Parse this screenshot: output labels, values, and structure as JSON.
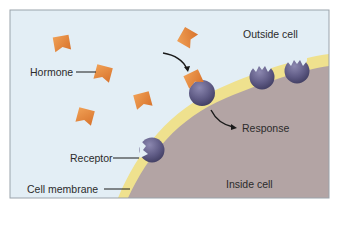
{
  "diagram": {
    "type": "cell-signaling-illustration",
    "regions": {
      "outside": {
        "label": "Outside cell",
        "color": "#e3eef5"
      },
      "inside": {
        "label": "Inside cell",
        "color": "#b3a4a4"
      },
      "membrane": {
        "label": "Cell membrane",
        "color": "#efe18e"
      }
    },
    "labels": {
      "hormone": "Hormone",
      "receptor": "Receptor",
      "cell_membrane": "Cell membrane",
      "outside_cell": "Outside cell",
      "inside_cell": "Inside cell",
      "response": "Response"
    },
    "colors": {
      "hormone": "#e98a3c",
      "receptor": "#6e6a92",
      "frame": "#9aa3ab",
      "arrow": "#1a1a1a"
    },
    "hormones": [
      {
        "x": 62,
        "y": 44,
        "rotate": -10
      },
      {
        "x": 103,
        "y": 74,
        "rotate": 15
      },
      {
        "x": 143,
        "y": 102,
        "rotate": -20
      },
      {
        "x": 85,
        "y": 117,
        "rotate": 20
      },
      {
        "x": 188,
        "y": 38,
        "rotate": 25
      }
    ],
    "bound_hormone": {
      "x": 194,
      "y": 79,
      "rotate": -25
    },
    "receptors": [
      {
        "name": "receptor-bound",
        "x": 202,
        "y": 93,
        "r": 13
      },
      {
        "name": "receptor-free-1",
        "x": 262,
        "y": 77,
        "r": 13
      },
      {
        "name": "receptor-free-2",
        "x": 297,
        "y": 71,
        "r": 13
      },
      {
        "name": "receptor-labeled",
        "x": 151,
        "y": 150,
        "r": 13
      }
    ]
  }
}
